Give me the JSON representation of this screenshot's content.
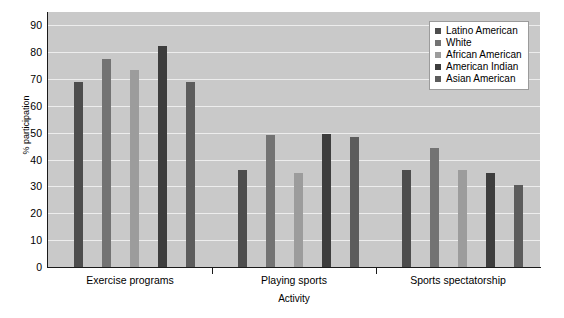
{
  "chart_data": {
    "type": "bar",
    "title": "",
    "subtitle": "",
    "xlabel": "Activity",
    "ylabel": "% participation",
    "categories": [
      "Exercise programs",
      "Playing sports",
      "Sports spectatorship"
    ],
    "series": [
      {
        "name": "Latino American",
        "color": "#4d4d4d",
        "values": [
          69,
          36,
          36
        ]
      },
      {
        "name": "White",
        "color": "#737373",
        "values": [
          77.5,
          49,
          44.5
        ]
      },
      {
        "name": "African American",
        "color": "#9c9c9c",
        "values": [
          73.5,
          35,
          36
        ]
      },
      {
        "name": "American Indian",
        "color": "#3d3d3d",
        "values": [
          82.5,
          49.5,
          35
        ]
      },
      {
        "name": "Asian American",
        "color": "#5c5c5c",
        "values": [
          69,
          48.5,
          30.5
        ]
      }
    ],
    "ylim": [
      0,
      95
    ],
    "yticks": [
      0,
      10,
      20,
      30,
      40,
      50,
      60,
      70,
      80,
      90
    ],
    "ytick_labels": [
      "0",
      "10",
      "20",
      "30",
      "40",
      "50",
      "60",
      "70",
      "80",
      "90"
    ],
    "grid": true,
    "grid_color": "#ededed",
    "plot_background": "#c9c9c9",
    "legend_position": "upper right",
    "legend_entries": [
      "Latino American",
      "White",
      "African American",
      "American Indian",
      "Asian American"
    ]
  }
}
